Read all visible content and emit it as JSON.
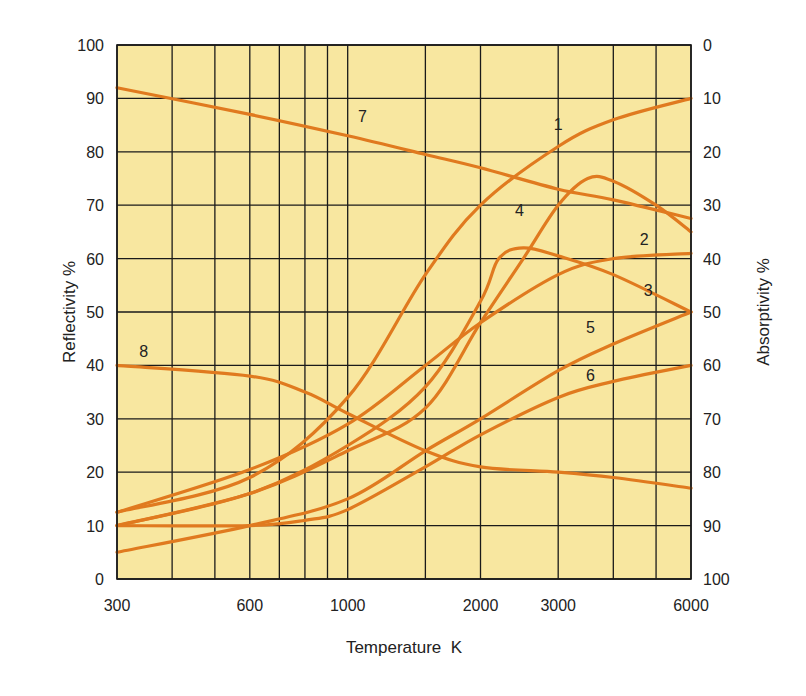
{
  "chart_data": {
    "type": "line",
    "title": "",
    "xlabel": "Temperature  K",
    "ylabel": "Reflectivity %",
    "ylabel_right": "Absorptivity %",
    "x_scale": "log",
    "xlim": [
      300,
      6000
    ],
    "ylim": [
      0,
      100
    ],
    "ylim_right": [
      100,
      0
    ],
    "grid": true,
    "legend": "inline numeric labels on curves",
    "x_tick_labels": [
      "300",
      "600",
      "1000",
      "2000",
      "3000",
      "6000"
    ],
    "x_tick_values": [
      300,
      600,
      1000,
      2000,
      3000,
      6000
    ],
    "x_grid_values": [
      300,
      400,
      500,
      600,
      700,
      800,
      900,
      1000,
      1500,
      2000,
      3000,
      4000,
      5000,
      6000
    ],
    "y_tick_labels": [
      "0",
      "10",
      "20",
      "30",
      "40",
      "50",
      "60",
      "70",
      "80",
      "90",
      "100"
    ],
    "y_right_tick_labels": [
      "100",
      "90",
      "80",
      "70",
      "60",
      "50",
      "40",
      "30",
      "20",
      "10",
      "0"
    ],
    "series": [
      {
        "name": "1",
        "label_at": [
          3000,
          84
        ],
        "x": [
          300,
          600,
          1000,
          1500,
          2000,
          3000,
          4000,
          6000
        ],
        "values": [
          12.5,
          19,
          34,
          57,
          70,
          81,
          86,
          90
        ]
      },
      {
        "name": "2",
        "label_at": [
          4700,
          62.5
        ],
        "x": [
          300,
          600,
          1000,
          1500,
          2000,
          3000,
          4000,
          6000
        ],
        "values": [
          12.5,
          20.5,
          29,
          40,
          48,
          57,
          60,
          61
        ]
      },
      {
        "name": "3",
        "label_at": [
          4800,
          53
        ],
        "x": [
          300,
          600,
          1000,
          1500,
          2000,
          2200,
          2500,
          3000,
          4000,
          6000
        ],
        "values": [
          10,
          16,
          25,
          36,
          52,
          60,
          62,
          60.5,
          57,
          50
        ]
      },
      {
        "name": "4",
        "label_at": [
          2450,
          68
        ],
        "x": [
          300,
          600,
          1000,
          1500,
          2000,
          2500,
          3000,
          3500,
          4000,
          5000,
          6000
        ],
        "values": [
          10,
          16,
          24,
          32,
          48,
          60,
          70,
          75,
          74.5,
          70,
          65
        ]
      },
      {
        "name": "5",
        "label_at": [
          3550,
          46
        ],
        "x": [
          300,
          600,
          1000,
          1500,
          2000,
          3000,
          4000,
          6000
        ],
        "values": [
          5,
          10,
          15,
          24,
          30,
          39,
          44,
          50
        ]
      },
      {
        "name": "6",
        "label_at": [
          3550,
          37
        ],
        "x": [
          300,
          600,
          800,
          1000,
          1500,
          2000,
          3000,
          4000,
          6000
        ],
        "values": [
          10,
          10,
          11,
          13,
          21,
          27,
          34,
          37,
          40
        ]
      },
      {
        "name": "7",
        "label_at": [
          1080,
          85.5
        ],
        "x": [
          300,
          600,
          1000,
          1500,
          2000,
          3000,
          4000,
          6000
        ],
        "values": [
          92,
          87,
          83,
          79.5,
          77,
          73,
          71,
          67.5
        ]
      },
      {
        "name": "8",
        "label_at": [
          345,
          41.5
        ],
        "x": [
          300,
          600,
          800,
          1000,
          1500,
          2000,
          3000,
          4000,
          6000
        ],
        "values": [
          40,
          38,
          35,
          31,
          24,
          21,
          20,
          19,
          17
        ]
      }
    ]
  },
  "colors": {
    "plot_background": "#F8E7A0",
    "curve": "#E07A1F",
    "grid": "#1a1a1a",
    "text": "#222222"
  }
}
